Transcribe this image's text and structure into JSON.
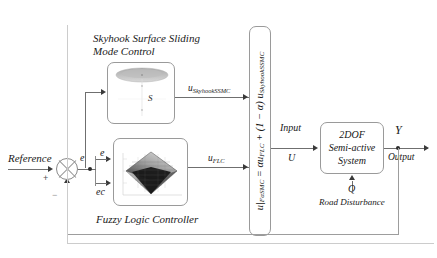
{
  "diagram": {
    "title_ssmc": "Skyhook Surface Sliding Mode Control",
    "title_ssmc_line1": "Skyhook Surface Sliding",
    "title_ssmc_line2": "Mode Control",
    "title_flc": "Fuzzy Logic  Controller"
  },
  "blocks": {
    "ssmc": {
      "name": "Skyhook Surface Sliding Mode Control",
      "surface_label": "S"
    },
    "flc": {
      "name": "Fuzzy Logic Controller",
      "input_1": "e",
      "input_2": "ec"
    },
    "mixer": {
      "equation": "u|FαSMC = αuFLC + (1 − α) uSkyhookSSMC",
      "eq_lhs": "u|",
      "eq_lhs_sub": "FαSMC",
      "eq_eq": " = αu",
      "eq_sub1": "FLC",
      "eq_mid": " + (1 − α) u",
      "eq_sub2": "SkyhookSSMC"
    },
    "plant": {
      "line1": "2DOF",
      "line2": "Semi-active",
      "line3": "System"
    }
  },
  "signals": {
    "reference": "Reference",
    "error": "e",
    "error_rate": "ec",
    "u_ssmc_base": "u",
    "u_ssmc_sub": "SkyhookSSMC",
    "u_flc_base": "u",
    "u_flc_sub": "FLC",
    "input_label": "Input",
    "input_symbol": "U",
    "output_symbol": "Y",
    "output_label": "Output",
    "disturbance_symbol": "Q",
    "disturbance_label": "Road Disturbance",
    "sign_plus": "+",
    "sign_minus": "−"
  },
  "colors": {
    "line": "#6f6f6f",
    "block_border": "#9a9a9a",
    "text": "#1a1a1a",
    "surface_dark": "#1b1b1b",
    "surface_light": "#cfcfcf"
  }
}
